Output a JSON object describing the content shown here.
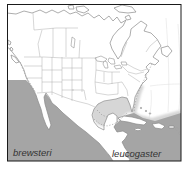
{
  "figure": {
    "type": "species-range-map",
    "region": "North America",
    "labels": [
      {
        "id": "brewsteri",
        "text": "brewsteri"
      },
      {
        "id": "leucogaster",
        "text": "leucogaster"
      }
    ],
    "colors": {
      "background": "#ffffff",
      "land": "#ffffff",
      "range_dark": "#a5a5a5",
      "range_light": "#d6d6d6",
      "coastline": "#8a8a8a",
      "admin_lines": "#a6a6a6",
      "dashed_boundary": "#8f8f8f",
      "graticule": "#dddddd",
      "frame": "#1a1a1a",
      "label_text": "#333333"
    }
  }
}
